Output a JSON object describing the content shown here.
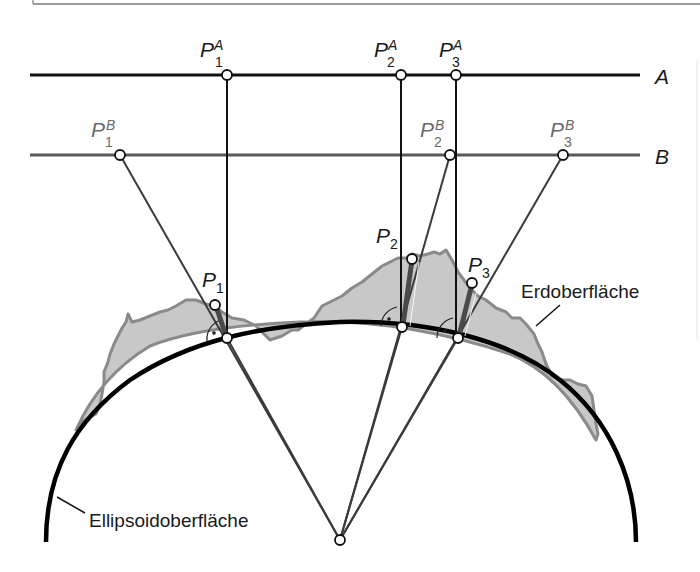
{
  "figure": {
    "frame_color": "#9a9a9a",
    "colors": {
      "line_a": "#111111",
      "line_b": "#5a5a5a",
      "ellipsoid": "#000000",
      "terrain_fill": "#c8c8c8",
      "terrain_stroke": "#8a8a8a",
      "ray": "#3a3a3a",
      "offset_bar": "#4a4a4a",
      "label_a": "#1a1a1a",
      "label_b": "#6a6a6a"
    },
    "reference_lines": [
      {
        "id": "A",
        "label": "A",
        "y": 75
      },
      {
        "id": "B",
        "label": "B",
        "y": 155
      }
    ],
    "projections_a": [
      {
        "base": "P",
        "sub": "1",
        "sup": "A",
        "x": 227
      },
      {
        "base": "P",
        "sub": "2",
        "sup": "A",
        "x": 401
      },
      {
        "base": "P",
        "sub": "3",
        "sup": "A",
        "x": 456
      }
    ],
    "projections_b": [
      {
        "base": "P",
        "sub": "1",
        "sup": "B",
        "x": 120
      },
      {
        "base": "P",
        "sub": "2",
        "sup": "B",
        "x": 450
      },
      {
        "base": "P",
        "sub": "3",
        "sup": "B",
        "x": 563
      }
    ],
    "surface_points": [
      {
        "base": "P",
        "sub": "1"
      },
      {
        "base": "P",
        "sub": "2"
      },
      {
        "base": "P",
        "sub": "3"
      }
    ],
    "labels": {
      "terrain": "Erdoberfläche",
      "ellipsoid": "Ellipsoidoberfläche"
    }
  }
}
